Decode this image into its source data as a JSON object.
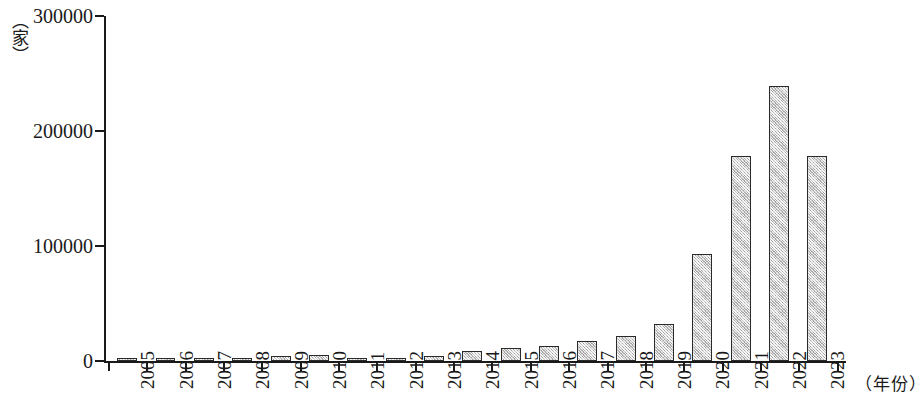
{
  "chart_data": {
    "type": "bar",
    "title": "",
    "subtitle": "",
    "xlabel": "（年份）",
    "ylabel": "（家）",
    "ylim": [
      0,
      300000
    ],
    "grid": false,
    "legend": null,
    "y_ticks": [
      0,
      100000,
      200000,
      300000
    ],
    "y_tick_labels": [
      "0",
      "100000",
      "200000",
      "300000"
    ],
    "categories": [
      "2005",
      "2006",
      "2007",
      "2008",
      "2009",
      "2010",
      "2011",
      "2012",
      "2013",
      "2014",
      "2015",
      "2016",
      "2017",
      "2018",
      "2019",
      "2020",
      "2021",
      "2022",
      "2023"
    ],
    "values": [
      2000,
      2500,
      2500,
      3000,
      4000,
      5000,
      2000,
      2500,
      4000,
      9000,
      11000,
      13000,
      17000,
      22000,
      32000,
      93000,
      178000,
      239000,
      178000
    ]
  }
}
